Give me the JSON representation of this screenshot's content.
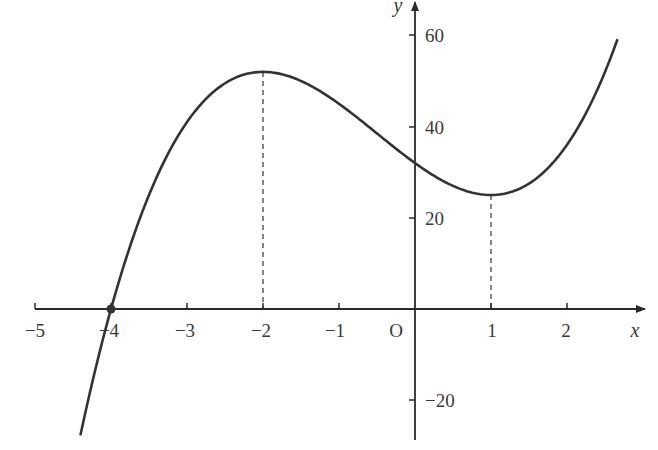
{
  "chart_data": {
    "type": "line",
    "title": "",
    "function": "y = 2x^3 + 3x^2 - 12x + 32",
    "xlabel": "x",
    "ylabel": "y",
    "origin_label": "O",
    "xlim": [
      -5,
      2.8
    ],
    "ylim": [
      -28,
      65
    ],
    "grid": false,
    "x_ticks": [
      -5,
      -4,
      -3,
      -2,
      -1,
      1,
      2
    ],
    "x_tick_labels": [
      "−5",
      "−4",
      "−3",
      "−2",
      "−1",
      "1",
      "2"
    ],
    "y_ticks": [
      60,
      40,
      20,
      -20
    ],
    "y_tick_labels": [
      "60",
      "40",
      "20",
      "−20"
    ],
    "series": [
      {
        "name": "curve",
        "x": [
          -4.4,
          -4.0,
          -3.5,
          -3.0,
          -2.5,
          -2.0,
          -1.5,
          -1.0,
          -0.5,
          0.0,
          0.5,
          1.0,
          1.5,
          2.0,
          2.5,
          2.66
        ],
        "y": [
          -27.5,
          0,
          24.5,
          41,
          49.5,
          52,
          50,
          45,
          38.5,
          32,
          27,
          25,
          27.5,
          36,
          52.5,
          59
        ]
      }
    ],
    "annotations": [
      {
        "type": "point",
        "x": -4,
        "y": 0,
        "label": "root"
      },
      {
        "type": "dashed-vline",
        "x": -2,
        "y_to": 52,
        "label": "local maximum"
      },
      {
        "type": "dashed-vline",
        "x": 1,
        "y_to": 25,
        "label": "local minimum"
      }
    ],
    "colors": {
      "curve": "#333333",
      "axes": "#2a2a2a",
      "text": "#3a3a3a"
    }
  }
}
